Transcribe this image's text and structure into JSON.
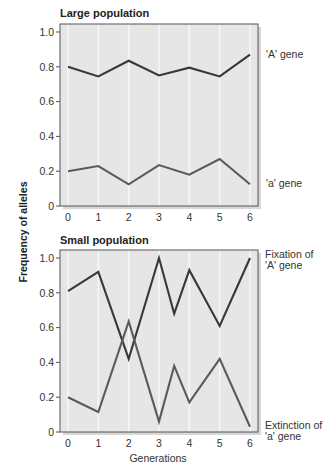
{
  "figure": {
    "y_axis_label": "Frequency of alleles",
    "x_axis_label": "Generations",
    "colors": {
      "plot_background": "#e6e6e6",
      "gridline": "#f7f7f7",
      "frame": "#555555",
      "line_A": "#383838",
      "line_a": "#5a5a5a"
    }
  },
  "chart_data": [
    {
      "type": "line",
      "title": "Large population",
      "xlabel": "Generations",
      "ylabel": "Frequency of alleles",
      "x_ticks": [
        "0",
        "1",
        "2",
        "3",
        "4",
        "5",
        "6"
      ],
      "y_ticks": [
        "0",
        "0.2",
        "0.4",
        "0.6",
        "0.8",
        "1.0"
      ],
      "xlim": [
        0,
        6
      ],
      "ylim": [
        0,
        1.0
      ],
      "grid": "vertical",
      "series": [
        {
          "name": "'A' gene",
          "x": [
            0,
            1,
            2,
            3,
            4,
            5,
            6
          ],
          "values": [
            0.8,
            0.745,
            0.835,
            0.75,
            0.795,
            0.745,
            0.87
          ]
        },
        {
          "name": "'a' gene",
          "x": [
            0,
            1,
            2,
            3,
            4,
            5,
            6
          ],
          "values": [
            0.2,
            0.23,
            0.125,
            0.235,
            0.18,
            0.27,
            0.125
          ]
        }
      ],
      "annotations": [
        "'A' gene",
        "'a' gene"
      ]
    },
    {
      "type": "line",
      "title": "Small population",
      "xlabel": "Generations",
      "ylabel": "Frequency of alleles",
      "x_ticks": [
        "0",
        "1",
        "2",
        "3",
        "4",
        "5",
        "6"
      ],
      "y_ticks": [
        "0",
        "0.2",
        "0.4",
        "0.6",
        "0.8",
        "1.0"
      ],
      "xlim": [
        0,
        6
      ],
      "ylim": [
        0,
        1.0
      ],
      "grid": "vertical",
      "series": [
        {
          "name": "'A' gene",
          "x": [
            0,
            1,
            2,
            3,
            3.5,
            4,
            5,
            6
          ],
          "values": [
            0.81,
            0.92,
            0.42,
            1.0,
            0.68,
            0.93,
            0.61,
            1.0
          ]
        },
        {
          "name": "'a' gene",
          "x": [
            0,
            1,
            2,
            3,
            3.5,
            4,
            5,
            6
          ],
          "values": [
            0.2,
            0.115,
            0.635,
            0.06,
            0.38,
            0.17,
            0.42,
            0.03
          ]
        }
      ],
      "annotations": [
        "Fixation of 'A' gene",
        "Extinction of 'a' gene"
      ]
    }
  ],
  "labels": {
    "large": {
      "title": "Large population",
      "A": "'A' gene",
      "a": "'a' gene"
    },
    "small": {
      "title": "Small population",
      "A_line1": "Fixation of",
      "A_line2": "'A' gene",
      "a_line1": "Extinction of",
      "a_line2": "'a' gene"
    },
    "y_ticks": [
      "0",
      "0.2",
      "0.4",
      "0.6",
      "0.8",
      "1.0"
    ],
    "x_ticks": [
      "0",
      "1",
      "2",
      "3",
      "4",
      "5",
      "6"
    ]
  }
}
